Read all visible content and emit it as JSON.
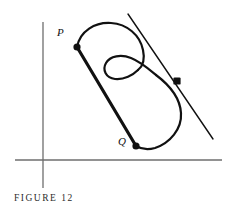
{
  "figure": {
    "caption": "FIGURE 12",
    "background_color": "#ffffff",
    "ink_color": "#111111",
    "axis_color": "#6e6e6e",
    "labels": {
      "point_p": "P",
      "point_q": "Q"
    },
    "points": [
      {
        "name": "P",
        "label": "P",
        "x": 77,
        "y": 47,
        "marker": "filled-dot"
      },
      {
        "name": "Q",
        "label": "Q",
        "x": 136,
        "y": 146,
        "marker": "filled-dot"
      },
      {
        "name": "tangency",
        "label": "",
        "x": 177,
        "y": 81,
        "marker": "filled-square-dot"
      }
    ],
    "axes": {
      "x_axis": {
        "x1": 15,
        "y1": 160,
        "x2": 222,
        "y2": 160
      },
      "y_axis": {
        "x1": 43,
        "y1": 22,
        "x2": 43,
        "y2": 188
      }
    },
    "chord": {
      "name": "secant-PQ",
      "from": "P",
      "to": "Q",
      "x1": 77,
      "y1": 47,
      "x2": 136,
      "y2": 146,
      "stroke_width": 3.2
    },
    "tangent_line": {
      "name": "tangent-line",
      "x1": 128,
      "y1": 14,
      "x2": 213,
      "y2": 139,
      "stroke_width": 1.4
    },
    "curve": {
      "name": "looped-curve",
      "stroke_width": 2.2,
      "description": "closed looping curve through P and Q with an inner crossing loop"
    }
  }
}
